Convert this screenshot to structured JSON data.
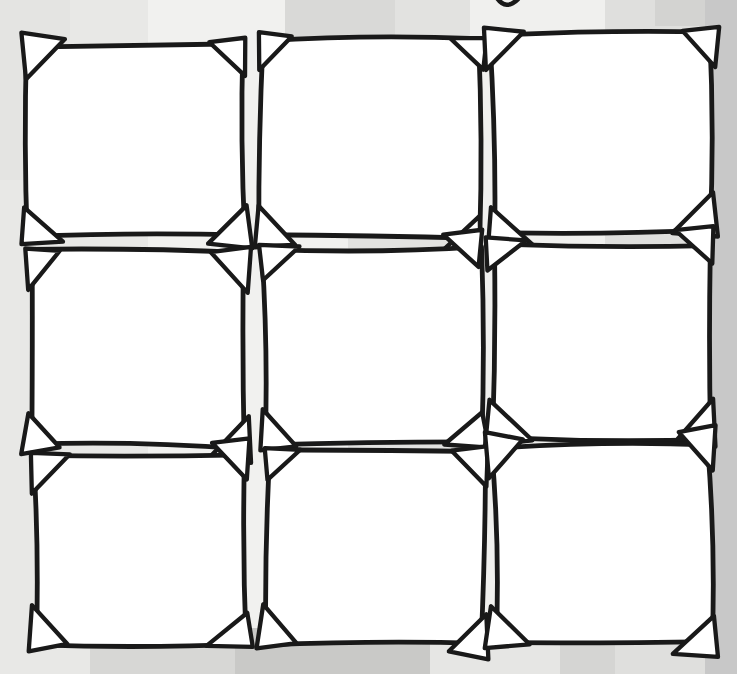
{
  "illustration": {
    "kind": "hand-drawn-photo-frame-grid",
    "grid": {
      "rows": 3,
      "columns": 3,
      "frame_count": 9
    },
    "canvas": {
      "width": 737,
      "height": 674
    },
    "colors": {
      "ink": "#191919",
      "frame_fill": "#ffffff",
      "corner_fill": "#ffffff",
      "background_base": "#e8e8e6"
    },
    "background": {
      "base_color": "#e8e8e6",
      "vertical_bands": [
        {
          "x": 148,
          "w": 200,
          "color": "#f1f1ef"
        },
        {
          "x": 348,
          "w": 122,
          "color": "#e2e2e0"
        },
        {
          "x": 470,
          "w": 135,
          "color": "#f0f0ee"
        },
        {
          "x": 605,
          "w": 100,
          "color": "#dfdfdd"
        },
        {
          "x": 705,
          "w": 32,
          "color": "#c8c8c8"
        }
      ],
      "patches": [
        {
          "x": 0,
          "y": 0,
          "w": 70,
          "h": 180,
          "color": "#e4e4e2"
        },
        {
          "x": 285,
          "y": 0,
          "w": 110,
          "h": 42,
          "color": "#d9d9d7"
        },
        {
          "x": 655,
          "y": 0,
          "w": 50,
          "h": 26,
          "color": "#d3d3d1"
        },
        {
          "x": 90,
          "y": 598,
          "w": 148,
          "h": 76,
          "color": "#d7d7d5"
        },
        {
          "x": 235,
          "y": 628,
          "w": 195,
          "h": 46,
          "color": "#c9c9c7"
        },
        {
          "x": 430,
          "y": 640,
          "w": 130,
          "h": 34,
          "color": "#e6e6e4"
        },
        {
          "x": 560,
          "y": 618,
          "w": 55,
          "h": 56,
          "color": "#d5d5d3"
        }
      ]
    },
    "stroke": {
      "frame_width": 4.8,
      "corner_width": 4.3
    },
    "corner_triangle": {
      "min_leg": 28,
      "max_leg": 40,
      "slip_probability": 0.38
    },
    "frames": [
      {
        "row": 0,
        "col": 0,
        "x": 27,
        "y": 44,
        "w": 218,
        "h": 190,
        "rot": -0.6,
        "seed": 11
      },
      {
        "row": 0,
        "col": 1,
        "x": 261,
        "y": 40,
        "w": 219,
        "h": 197,
        "rot": 0.4,
        "seed": 22
      },
      {
        "row": 0,
        "col": 2,
        "x": 492,
        "y": 34,
        "w": 218,
        "h": 198,
        "rot": -0.5,
        "seed": 33
      },
      {
        "row": 1,
        "col": 0,
        "x": 31,
        "y": 252,
        "w": 212,
        "h": 195,
        "rot": 0.5,
        "seed": 44
      },
      {
        "row": 1,
        "col": 1,
        "x": 264,
        "y": 247,
        "w": 216,
        "h": 196,
        "rot": -0.3,
        "seed": 55
      },
      {
        "row": 1,
        "col": 2,
        "x": 493,
        "y": 243,
        "w": 217,
        "h": 195,
        "rot": 0.3,
        "seed": 66
      },
      {
        "row": 2,
        "col": 0,
        "x": 34,
        "y": 456,
        "w": 212,
        "h": 188,
        "rot": -0.4,
        "seed": 77
      },
      {
        "row": 2,
        "col": 1,
        "x": 267,
        "y": 452,
        "w": 217,
        "h": 192,
        "rot": 0.5,
        "seed": 88
      },
      {
        "row": 2,
        "col": 2,
        "x": 494,
        "y": 447,
        "w": 216,
        "h": 196,
        "rot": -0.3,
        "seed": 99
      }
    ],
    "top_edge_mark": {
      "path": "M 497 -2 Q 506 11 518 -1"
    }
  }
}
